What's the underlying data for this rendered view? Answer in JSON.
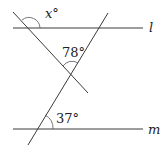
{
  "figure": {
    "type": "geometry",
    "lines": {
      "l": {
        "label": "l",
        "role": "parallel line (top)"
      },
      "m": {
        "label": "m",
        "role": "parallel line (bottom)"
      }
    },
    "angles": {
      "x": {
        "label": "x°",
        "location": "at left transversal and line l, above l"
      },
      "a78": {
        "label": "78°",
        "location": "between transversals at their intersection, top angle"
      },
      "a37": {
        "label": "37°",
        "location": "at right transversal and line m, above m on the right"
      }
    },
    "colors": {
      "stroke": "#3a3a3a",
      "text": "#222222",
      "background": "#ffffff"
    }
  }
}
